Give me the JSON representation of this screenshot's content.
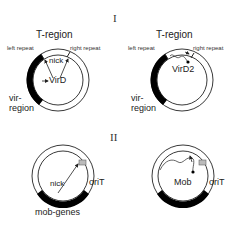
{
  "panels": [
    {
      "numeral": "I",
      "diagrams": [
        {
          "title": "T-region",
          "left_repeat": "left repeat",
          "right_repeat": "right repeat",
          "nick": "nick",
          "protein": "VirD",
          "region_line1": "vir-",
          "region_line2": "region"
        },
        {
          "title": "T-region",
          "left_repeat": "left repeat",
          "right_repeat": "right repeat",
          "protein": "VirD2",
          "region_line1": "vir-",
          "region_line2": "region"
        }
      ]
    },
    {
      "numeral": "II",
      "diagrams": [
        {
          "nick": "nick",
          "origin": "oriT",
          "genes": "mob-genes"
        },
        {
          "protein": "Mob",
          "origin": "oriT"
        }
      ]
    }
  ],
  "colors": {
    "line": "#222222",
    "fill": "#000000",
    "oriT_box": "#bbbbbb"
  }
}
